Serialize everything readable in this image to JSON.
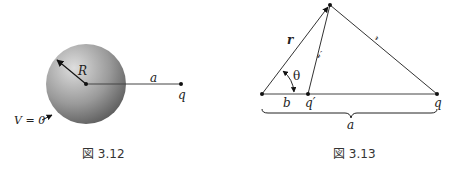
{
  "figure_left": {
    "caption": "図 3.12",
    "labels": {
      "radius": "R",
      "distance": "a",
      "charge": "q",
      "potential": "V = 0"
    }
  },
  "figure_right": {
    "caption": "図 3.13",
    "labels": {
      "r": "r",
      "angle": "θ",
      "b": "b",
      "q_image": "q′",
      "q": "q",
      "script_r_prime": "𝓇′",
      "script_r": "𝓇",
      "a": "a"
    }
  },
  "colors": {
    "line": "#333333",
    "sphere_light": "#d8d8d8",
    "sphere_dark": "#6a6a6a"
  }
}
